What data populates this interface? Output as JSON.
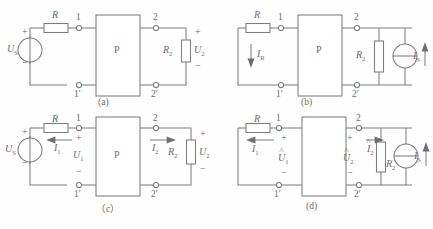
{
  "figure": {
    "line_color": "#7d7d7d",
    "text_color": "#6d6d6d",
    "background": "#fefefe"
  },
  "panels": [
    {
      "id": "a",
      "caption": "(a)",
      "box_label": "P",
      "source": {
        "kind": "voltage-source",
        "label": "U",
        "sub": "S",
        "plus": "+",
        "minus": "−"
      },
      "series_resistor": {
        "label": "R"
      },
      "load": {
        "label": "R",
        "sub": "2"
      },
      "load_voltage": {
        "label": "U",
        "sub": "2",
        "plus": "+",
        "minus": "−"
      },
      "terminals": {
        "tl": "1",
        "bl": "1′",
        "tr": "2",
        "br": "2′"
      }
    },
    {
      "id": "b",
      "caption": "(b)",
      "box_label": "P",
      "series_resistor": {
        "label": "R"
      },
      "branch_current": {
        "label": "I",
        "sub": "R",
        "direction": "down"
      },
      "load": {
        "label": "R",
        "sub": "2"
      },
      "source": {
        "kind": "current-source",
        "label": "I",
        "sub": "S",
        "direction": "up"
      },
      "terminals": {
        "tl": "1",
        "bl": "1′",
        "tr": "2",
        "br": "2′"
      }
    },
    {
      "id": "c",
      "caption": "（c）",
      "box_label": "P",
      "source": {
        "kind": "voltage-source",
        "label": "U",
        "sub": "S",
        "plus": "+",
        "minus": "−"
      },
      "series_resistor": {
        "label": "R"
      },
      "current_1": {
        "label": "I",
        "sub": "1",
        "direction": "left"
      },
      "voltage_1": {
        "label": "U",
        "sub": "1",
        "plus": "+",
        "minus": "−"
      },
      "current_2": {
        "label": "I",
        "sub": "2",
        "direction": "right"
      },
      "load": {
        "label": "R",
        "sub": "2"
      },
      "voltage_2": {
        "label": "U",
        "sub": "2",
        "plus": "+",
        "minus": "−"
      },
      "terminals": {
        "tl": "1",
        "bl": "1′",
        "tr": "2",
        "br": "2′"
      }
    },
    {
      "id": "d",
      "caption": "(d)",
      "box_label": "",
      "series_resistor": {
        "label": "R"
      },
      "current_1": {
        "label": "I",
        "sub": "1",
        "hat": true,
        "direction": "left"
      },
      "voltage_1": {
        "label": "U",
        "sub": "1",
        "hat": true,
        "plus": "+",
        "minus": "−"
      },
      "current_2": {
        "label": "I",
        "sub": "2",
        "hat": true,
        "direction": "right"
      },
      "voltage_2": {
        "label": "U",
        "sub": "2",
        "hat": true,
        "plus": "+",
        "minus": "−"
      },
      "load": {
        "label": "R",
        "sub": "2"
      },
      "source": {
        "kind": "current-source",
        "label": "I",
        "sub": "S",
        "direction": "up"
      },
      "terminals": {
        "tl": "1",
        "bl": "1′",
        "tr": "2",
        "br": "2′"
      }
    }
  ]
}
